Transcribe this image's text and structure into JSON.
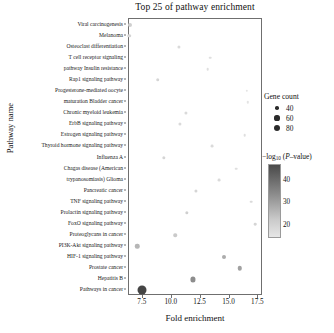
{
  "chart_data": {
    "type": "scatter",
    "title": "Top 25 of pathway enrichment",
    "xlabel": "Fold enrichment",
    "ylabel": "Pathway name",
    "xlim": [
      6.3,
      17.9
    ],
    "xticks": [
      7.5,
      10.0,
      12.5,
      15.0,
      17.5
    ],
    "xtick_labels": [
      "7.5",
      "10.0",
      "12.5",
      "15.0",
      "17.5"
    ],
    "grid": false,
    "legend_position": "right",
    "categories": [
      "Viral carcinogenesis",
      "Melanoma",
      "Osteoclast differentiation",
      "T cell receptor signaling",
      "pathway Insulin resistance",
      "Rap1 signaling pathway",
      "Progesterone-mediated oocyte",
      "maturation Bladder cancer",
      "Chronic myeloid leukemia",
      "ErbB signaling pathway",
      "Estrogen signaling pathway",
      "Thyroid hormone signaling pathway",
      "Influenza A",
      "Chagas disease (American",
      "trypanosomiasis) Glioma",
      "Pancreatic cancer",
      "TNF signaling pathway",
      "Prolactin signaling pathway",
      "FoxO signaling pathway",
      "Proteoglycans in cancer",
      "PI3K-Akt signaling pathway",
      "HIF-1 signaling pathway",
      "Prostate cancer",
      "Hepatitis B",
      "Pathways in cancer"
    ],
    "points": [
      {
        "label": "Viral carcinogenesis",
        "x": 6.35,
        "gene_count": 34,
        "neg_log10_p": 19
      },
      {
        "label": "Melanoma",
        "x": 6.3,
        "gene_count": 30,
        "neg_log10_p": 18
      },
      {
        "label": "Osteoclast differentiation",
        "x": 10.6,
        "gene_count": 26,
        "neg_log10_p": 17
      },
      {
        "label": "T cell receptor signaling",
        "x": 13.3,
        "gene_count": 22,
        "neg_log10_p": 16
      },
      {
        "label": "pathway Insulin resistance",
        "x": 13.1,
        "gene_count": 22,
        "neg_log10_p": 16
      },
      {
        "label": "Rap1 signaling pathway",
        "x": 8.8,
        "gene_count": 30,
        "neg_log10_p": 18
      },
      {
        "label": "Progesterone-mediated oocyte",
        "x": 16.5,
        "gene_count": 20,
        "neg_log10_p": 15
      },
      {
        "label": "maturation Bladder cancer",
        "x": 16.6,
        "gene_count": 20,
        "neg_log10_p": 15
      },
      {
        "label": "Chronic myeloid leukemia",
        "x": 11.2,
        "gene_count": 26,
        "neg_log10_p": 17
      },
      {
        "label": "ErbB signaling pathway",
        "x": 10.7,
        "gene_count": 26,
        "neg_log10_p": 17
      },
      {
        "label": "Estrogen signaling pathway",
        "x": 16.3,
        "gene_count": 22,
        "neg_log10_p": 16
      },
      {
        "label": "Thyroid hormone signaling pathway",
        "x": 13.5,
        "gene_count": 24,
        "neg_log10_p": 17
      },
      {
        "label": "Influenza A",
        "x": 9.3,
        "gene_count": 28,
        "neg_log10_p": 18
      },
      {
        "label": "Chagas disease (American",
        "x": 15.6,
        "gene_count": 22,
        "neg_log10_p": 16
      },
      {
        "label": "trypanosomiasis) Glioma",
        "x": 14.1,
        "gene_count": 24,
        "neg_log10_p": 17
      },
      {
        "label": "Pancreatic cancer",
        "x": 12.1,
        "gene_count": 26,
        "neg_log10_p": 18
      },
      {
        "label": "TNF signaling pathway",
        "x": 16.9,
        "gene_count": 22,
        "neg_log10_p": 17
      },
      {
        "label": "Prolactin signaling pathway",
        "x": 11.3,
        "gene_count": 28,
        "neg_log10_p": 19
      },
      {
        "label": "FoxO signaling pathway",
        "x": 17.2,
        "gene_count": 22,
        "neg_log10_p": 18
      },
      {
        "label": "Proteoglycans in cancer",
        "x": 10.3,
        "gene_count": 30,
        "neg_log10_p": 20
      },
      {
        "label": "PI3K-Akt signaling pathway",
        "x": 7.0,
        "gene_count": 38,
        "neg_log10_p": 24
      },
      {
        "label": "HIF-1 signaling pathway",
        "x": 14.5,
        "gene_count": 34,
        "neg_log10_p": 26
      },
      {
        "label": "Prostate cancer",
        "x": 15.9,
        "gene_count": 38,
        "neg_log10_p": 28
      },
      {
        "label": "Hepatitis B",
        "x": 11.8,
        "gene_count": 44,
        "neg_log10_p": 32
      },
      {
        "label": "Pathways in cancer",
        "x": 7.4,
        "gene_count": 78,
        "neg_log10_p": 46
      }
    ],
    "size_legend": {
      "title": "Gene count",
      "values": [
        40,
        60,
        80
      ],
      "labels": [
        "40",
        "60",
        "80"
      ]
    },
    "color_legend": {
      "title_prefix": "−log",
      "title_sub": "10",
      "title_suffix_open": " (",
      "title_italic": "P",
      "title_suffix_close": "–value)",
      "ticks": [
        40,
        30,
        20
      ],
      "tick_labels": [
        "40",
        "30",
        "20"
      ],
      "range": [
        14,
        47
      ],
      "color_high": "#4a4a4a",
      "color_low": "#e6e6e6"
    }
  }
}
